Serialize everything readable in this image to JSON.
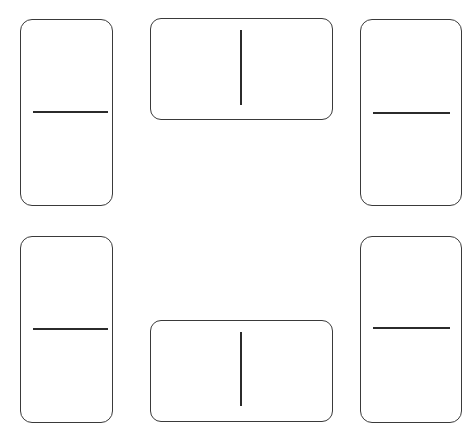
{
  "diagram": {
    "background_color": "#ffffff",
    "outline_color": "#3a3a3a",
    "divider_color": "#2b2b2b",
    "canvas": {
      "width": 473,
      "height": 431
    },
    "tile_count": 6,
    "tiles": [
      {
        "id": "tile-top-left",
        "position": "top-left",
        "orientation": "vertical",
        "x": 20,
        "y": 19,
        "width": 93,
        "height": 187,
        "corner_radius": 12,
        "divider": {
          "orientation": "horizontal",
          "x": 33,
          "y": 111,
          "length": 75
        },
        "pips": 0
      },
      {
        "id": "tile-top-center",
        "position": "top-center",
        "orientation": "horizontal",
        "x": 150,
        "y": 18,
        "width": 183,
        "height": 102,
        "corner_radius": 11,
        "divider": {
          "orientation": "vertical",
          "x": 240,
          "y": 30,
          "length": 75
        },
        "pips": 0
      },
      {
        "id": "tile-top-right",
        "position": "top-right",
        "orientation": "vertical",
        "x": 360,
        "y": 19,
        "width": 102,
        "height": 187,
        "corner_radius": 12,
        "divider": {
          "orientation": "horizontal",
          "x": 373,
          "y": 112,
          "length": 77
        },
        "pips": 0
      },
      {
        "id": "tile-bottom-left",
        "position": "bottom-left",
        "orientation": "vertical",
        "x": 20,
        "y": 236,
        "width": 93,
        "height": 187,
        "corner_radius": 12,
        "divider": {
          "orientation": "horizontal",
          "x": 33,
          "y": 328,
          "length": 75
        },
        "pips": 0
      },
      {
        "id": "tile-bottom-center",
        "position": "bottom-center",
        "orientation": "horizontal",
        "x": 150,
        "y": 320,
        "width": 183,
        "height": 102,
        "corner_radius": 11,
        "divider": {
          "orientation": "vertical",
          "x": 240,
          "y": 332,
          "length": 74
        },
        "pips": 0
      },
      {
        "id": "tile-bottom-right",
        "position": "bottom-right",
        "orientation": "vertical",
        "x": 360,
        "y": 236,
        "width": 102,
        "height": 187,
        "corner_radius": 12,
        "divider": {
          "orientation": "horizontal",
          "x": 373,
          "y": 327,
          "length": 77
        },
        "pips": 0
      }
    ]
  }
}
